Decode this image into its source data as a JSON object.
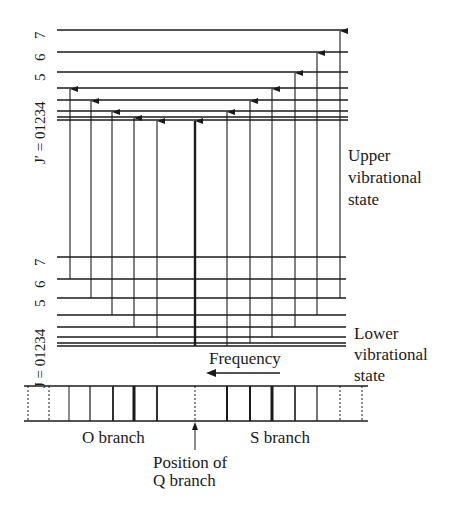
{
  "upper_levels": {
    "axis_label": "J′ = 01234",
    "labels": [
      "7",
      "6",
      "5"
    ],
    "title": [
      "Upper",
      "vibrational",
      "state"
    ]
  },
  "lower_levels": {
    "axis_label": "J = 01234",
    "labels": [
      "7",
      "6",
      "5"
    ],
    "title": [
      "Lower",
      "vibrational",
      "state"
    ]
  },
  "frequency_label": "Frequency",
  "spectrum": {
    "o_branch_label": "O branch",
    "s_branch_label": "S branch",
    "q_position_label": [
      "Position of",
      "Q branch"
    ]
  },
  "colors": {
    "line": "#1a1a1a",
    "background": "#ffffff"
  }
}
